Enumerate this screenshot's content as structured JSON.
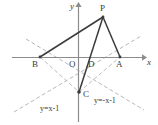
{
  "figure": {
    "axes": {
      "x_label": "x",
      "y_label": "y",
      "origin_label": "O"
    },
    "points": [
      {
        "id": "P",
        "label": "P",
        "x": 103,
        "y": 17
      },
      {
        "id": "B",
        "label": "B",
        "x": 40,
        "y": 57
      },
      {
        "id": "A",
        "label": "A",
        "x": 120,
        "y": 57
      },
      {
        "id": "C",
        "label": "C",
        "x": 79,
        "y": 92
      },
      {
        "id": "D",
        "label": "D",
        "x": 92,
        "y": 57
      },
      {
        "id": "O",
        "label": "O",
        "x": 79,
        "y": 57
      }
    ],
    "line_equations": [
      {
        "id": "line-left",
        "label": "y=x-1"
      },
      {
        "id": "line-right",
        "label": "y=-x-1"
      }
    ],
    "colors": {
      "axis": "#8c8c8c",
      "solid_stroke": "#3b3b3b",
      "dashed_stroke": "#b3b3b3",
      "text": "#3a3a3a",
      "background": "#ffffff"
    }
  }
}
